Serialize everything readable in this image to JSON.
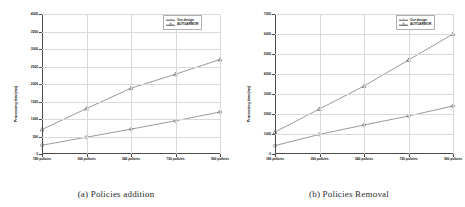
{
  "figure": {
    "panels": [
      {
        "id": "policies-addition",
        "caption": "(a) Policies addition",
        "ylabel": "Processing time(ms)",
        "legend": {
          "position": "top-right",
          "entries": [
            {
              "label": "Our design",
              "marker": "circle",
              "color": "#555555"
            },
            {
              "label": "AUTOARMOR",
              "marker": "triangle",
              "color": "#555555"
            }
          ]
        },
        "chart_data": {
          "type": "line",
          "title": "(a) Policies addition",
          "xlabel": "",
          "ylabel": "Processing time(ms)",
          "categories": [
            "180 policies",
            "360 policies",
            "540 policies",
            "720 policies",
            "900 policies"
          ],
          "ylim": [
            0,
            4000
          ],
          "yticks": [
            0,
            500,
            1000,
            1500,
            2000,
            2500,
            3000,
            3500,
            4000
          ],
          "ytick_labels": [
            "0",
            "500",
            "1000",
            "1500",
            "2000",
            "2500",
            "3000",
            "3500",
            "4000"
          ],
          "grid": true,
          "legend_position": "upper right",
          "series": [
            {
              "name": "Our design",
              "values": [
                250,
                480,
                710,
                950,
                1200
              ]
            },
            {
              "name": "AUTOARMOR",
              "values": [
                700,
                1300,
                1880,
                2280,
                2700
              ]
            }
          ]
        }
      },
      {
        "id": "policies-removal",
        "caption": "(b) Policies Removal",
        "ylabel": "Processing time(ms)",
        "legend": {
          "position": "top-right",
          "entries": [
            {
              "label": "Our design",
              "marker": "circle",
              "color": "#555555"
            },
            {
              "label": "AUTOARMOR",
              "marker": "triangle",
              "color": "#555555"
            }
          ]
        },
        "chart_data": {
          "type": "line",
          "title": "(b) Policies Removal",
          "xlabel": "",
          "ylabel": "Processing time(ms)",
          "categories": [
            "180 policies",
            "360 policies",
            "540 policies",
            "720 policies",
            "900 policies"
          ],
          "ylim": [
            0,
            7000
          ],
          "yticks": [
            0,
            1000,
            2000,
            3000,
            4000,
            5000,
            6000,
            7000
          ],
          "ytick_labels": [
            "0",
            "1000",
            "2000",
            "3000",
            "4000",
            "5000",
            "6000",
            "7000"
          ],
          "grid": true,
          "legend_position": "upper right",
          "series": [
            {
              "name": "Our design",
              "values": [
                420,
                980,
                1450,
                1900,
                2400
              ]
            },
            {
              "name": "AUTOARMOR",
              "values": [
                1100,
                2250,
                3400,
                4700,
                6000
              ]
            }
          ]
        }
      }
    ]
  }
}
